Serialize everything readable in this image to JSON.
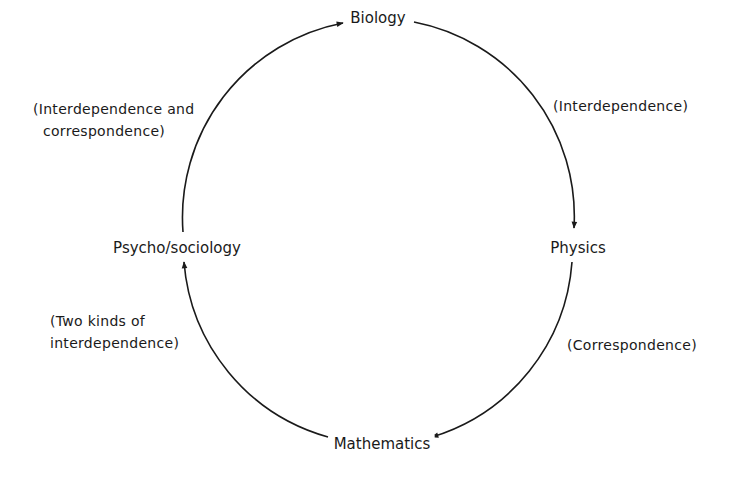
{
  "diagram": {
    "type": "cycle",
    "direction": "clockwise",
    "nodes": [
      {
        "id": "biology",
        "label": "Biology"
      },
      {
        "id": "physics",
        "label": "Physics"
      },
      {
        "id": "mathematics",
        "label": "Mathematics"
      },
      {
        "id": "psycho_sociology",
        "label": "Psycho/sociology"
      }
    ],
    "edges": [
      {
        "from": "biology",
        "to": "physics",
        "label_lines": [
          "(Interdependence)"
        ]
      },
      {
        "from": "physics",
        "to": "mathematics",
        "label_lines": [
          "(Correspondence)"
        ]
      },
      {
        "from": "mathematics",
        "to": "psycho_sociology",
        "label_lines": [
          "(Two kinds of",
          "interdependence)"
        ]
      },
      {
        "from": "psycho_sociology",
        "to": "biology",
        "label_lines": [
          "(Interdependence and",
          "correspondence)"
        ]
      }
    ],
    "colors": {
      "line": "#1a1a1a",
      "text": "#1a1a1a",
      "background": "#ffffff"
    }
  }
}
